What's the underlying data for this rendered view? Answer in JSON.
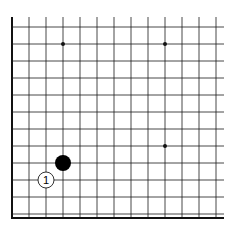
{
  "board": {
    "description": "Partial Go board (lower-left corner region) with grid, star points and two stones",
    "origin_x": 12,
    "origin_y": 27,
    "spacing": 17,
    "columns": 13,
    "rows": 12,
    "top_line_start_y": 17,
    "right_line_end_x": 224,
    "bottom_border_y": 218,
    "line_color": "#1a1a1a",
    "border_color": "#111111",
    "background": "#ffffff"
  },
  "star_points": [
    {
      "col": 3,
      "row": 1
    },
    {
      "col": 9,
      "row": 1
    },
    {
      "col": 9,
      "row": 7
    }
  ],
  "stones": [
    {
      "color": "black",
      "col": 3,
      "row": 8,
      "label": ""
    },
    {
      "color": "white",
      "col": 2,
      "row": 9,
      "label": "1"
    }
  ]
}
